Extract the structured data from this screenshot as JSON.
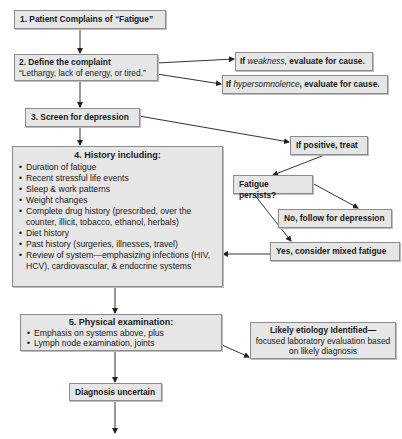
{
  "nodes": {
    "step1": {
      "label": "1. Patient Complains of “Fatigue”"
    },
    "step2": {
      "title": "2. Define the complaint",
      "subtitle": "“Lethargy, lack of energy, or tired.”"
    },
    "weakness": {
      "prefix": "If ",
      "term": "weakness,",
      "suffix": " evaluate for cause."
    },
    "hypersomnolence": {
      "prefix": "If ",
      "term": "hypersomnolence",
      "suffix": ", evaluate for cause."
    },
    "step3": {
      "label": "3. Screen for depression"
    },
    "if_positive": {
      "label": "If positive, treat"
    },
    "step4": {
      "title": "4. History including:",
      "items": [
        "Duration of fatigue",
        "Recent stressful life events",
        "Sleep & work patterns",
        "Weight changes",
        "Complete drug history (prescribed, over the counter, illicit, tobacco, ethanol, herbals)",
        "Diet history",
        "Past history (surgeries, illnesses, travel)",
        "Review of system—emphasizing infections (HIV, HCV), cardiovascular, & endocrine systems"
      ]
    },
    "fatigue_persists": {
      "label": "Fatigue persists?"
    },
    "no_follow": {
      "label": "No, follow for depression"
    },
    "yes_mixed": {
      "label": "Yes, consider mixed fatigue"
    },
    "step5": {
      "title": "5. Physical examination:",
      "items": [
        "Emphasis on systems above, plus",
        "Lymph node examination, joints"
      ]
    },
    "likely_etiology": {
      "title": "Likely etiology Identified—",
      "body": "focused laboratory evaluation based on likely diagnosis"
    },
    "diagnosis_uncertain": {
      "label": "Diagnosis uncertain"
    }
  },
  "colors": {
    "box_fill": "#e6e6e6",
    "box_border": "#8c8c8c",
    "line": "#333333"
  }
}
